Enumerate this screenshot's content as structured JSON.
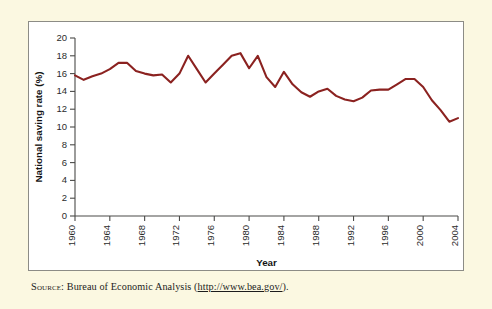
{
  "figure": {
    "background_color": "#fbf8e1",
    "panel_color": "#ffffff",
    "panel_border_color": "#8c8c86",
    "source_label": "Source:",
    "source_text": " Bureau of Economic Analysis (",
    "source_url": "http://www.bea.gov/",
    "source_tail": ")."
  },
  "chart_data": {
    "type": "line",
    "title": "",
    "xlabel": "Year",
    "ylabel": "National saving rate (%)",
    "xlim": [
      1960,
      2004
    ],
    "ylim": [
      0,
      20
    ],
    "grid": false,
    "legend": false,
    "line_color": "#8b2220",
    "ytick_labels": [
      "0",
      "2",
      "4",
      "6",
      "8",
      "10",
      "12",
      "14",
      "16",
      "18",
      "20"
    ],
    "yticks": [
      0,
      2,
      4,
      6,
      8,
      10,
      12,
      14,
      16,
      18,
      20
    ],
    "xtick_labels": [
      "1960",
      "1964",
      "1968",
      "1972",
      "1976",
      "1980",
      "1984",
      "1988",
      "1992",
      "1996",
      "2000",
      "2004"
    ],
    "xticks": [
      1960,
      1964,
      1968,
      1972,
      1976,
      1980,
      1984,
      1988,
      1992,
      1996,
      2000,
      2004
    ],
    "x": [
      1960,
      1961,
      1962,
      1963,
      1964,
      1965,
      1966,
      1967,
      1968,
      1969,
      1970,
      1971,
      1972,
      1973,
      1974,
      1975,
      1976,
      1977,
      1978,
      1979,
      1980,
      1981,
      1982,
      1983,
      1984,
      1985,
      1986,
      1987,
      1988,
      1989,
      1990,
      1991,
      1992,
      1993,
      1994,
      1995,
      1996,
      1997,
      1998,
      1999,
      2000,
      2001,
      2002,
      2003,
      2004
    ],
    "values": [
      15.8,
      15.3,
      15.7,
      16.0,
      16.5,
      17.2,
      17.2,
      16.3,
      16.0,
      15.8,
      15.9,
      15.0,
      16.0,
      18.0,
      16.5,
      15.0,
      16.0,
      17.0,
      18.0,
      18.3,
      16.6,
      18.0,
      15.6,
      14.5,
      16.2,
      14.8,
      13.9,
      13.4,
      14.0,
      14.3,
      13.5,
      13.1,
      12.9,
      13.3,
      14.1,
      14.2,
      14.2,
      14.8,
      15.4,
      15.4,
      14.5,
      13.0,
      11.9,
      10.6,
      11.0
    ]
  }
}
